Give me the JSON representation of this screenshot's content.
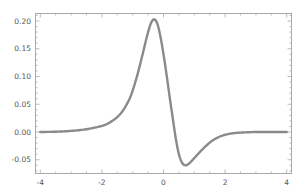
{
  "chart_data": {
    "type": "line",
    "title": "",
    "xlabel": "",
    "ylabel": "",
    "xlim": [
      -4,
      4
    ],
    "ylim": [
      -0.075,
      0.215
    ],
    "grid": false,
    "legend": null,
    "x_ticks": [
      -4,
      -2,
      0,
      2,
      4
    ],
    "x_tick_labels": [
      "-4",
      "-2",
      "0",
      "2",
      "4"
    ],
    "y_ticks": [
      -0.05,
      0.0,
      0.05,
      0.1,
      0.15,
      0.2
    ],
    "y_tick_labels": [
      "-0.05",
      "0.00",
      "0.05",
      "0.10",
      "0.15",
      "0.20"
    ],
    "series": [
      {
        "name": "curve",
        "color": "#8a8a8a",
        "x": [
          -4,
          -3.5,
          -3,
          -2.5,
          -2,
          -1.75,
          -1.5,
          -1.3,
          -1.1,
          -1.0,
          -0.9,
          -0.8,
          -0.7,
          -0.6,
          -0.5,
          -0.4,
          -0.3,
          -0.2,
          -0.1,
          0.0,
          0.1,
          0.2,
          0.3,
          0.4,
          0.5,
          0.6,
          0.7,
          0.8,
          0.9,
          1.0,
          1.2,
          1.4,
          1.6,
          1.8,
          2.0,
          2.3,
          2.6,
          3.0,
          3.5,
          4.0
        ],
        "y": [
          0.0,
          0.0005,
          0.002,
          0.005,
          0.011,
          0.017,
          0.027,
          0.04,
          0.06,
          0.075,
          0.093,
          0.113,
          0.135,
          0.158,
          0.18,
          0.197,
          0.203,
          0.195,
          0.172,
          0.14,
          0.103,
          0.063,
          0.025,
          -0.012,
          -0.04,
          -0.055,
          -0.06,
          -0.058,
          -0.053,
          -0.047,
          -0.035,
          -0.024,
          -0.015,
          -0.009,
          -0.005,
          -0.002,
          -0.0008,
          0.0,
          0.0,
          0.0
        ]
      }
    ]
  },
  "axes": {
    "x_labels": [
      "-4",
      "-2",
      "0",
      "2",
      "4"
    ],
    "y_labels": [
      "-0.05",
      "0.00",
      "0.05",
      "0.10",
      "0.15",
      "0.20"
    ]
  }
}
